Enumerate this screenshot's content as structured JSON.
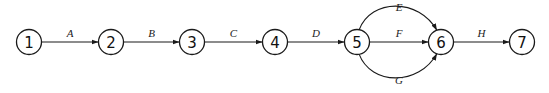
{
  "diagram": {
    "type": "activity-network",
    "nodes": [
      {
        "id": "1",
        "label": "1"
      },
      {
        "id": "2",
        "label": "2"
      },
      {
        "id": "3",
        "label": "3"
      },
      {
        "id": "4",
        "label": "4"
      },
      {
        "id": "5",
        "label": "5"
      },
      {
        "id": "6",
        "label": "6"
      },
      {
        "id": "7",
        "label": "7"
      }
    ],
    "edges": [
      {
        "from": "1",
        "to": "2",
        "label": "A",
        "route": "straight"
      },
      {
        "from": "2",
        "to": "3",
        "label": "B",
        "route": "straight"
      },
      {
        "from": "3",
        "to": "4",
        "label": "C",
        "route": "straight"
      },
      {
        "from": "4",
        "to": "5",
        "label": "D",
        "route": "straight"
      },
      {
        "from": "5",
        "to": "6",
        "label": "E",
        "route": "arc-above"
      },
      {
        "from": "5",
        "to": "6",
        "label": "F",
        "route": "straight"
      },
      {
        "from": "5",
        "to": "6",
        "label": "G",
        "route": "arc-below"
      },
      {
        "from": "6",
        "to": "7",
        "label": "H",
        "route": "straight"
      }
    ],
    "colors": {
      "stroke": "#1a1a1a",
      "background": "#ffffff"
    }
  }
}
